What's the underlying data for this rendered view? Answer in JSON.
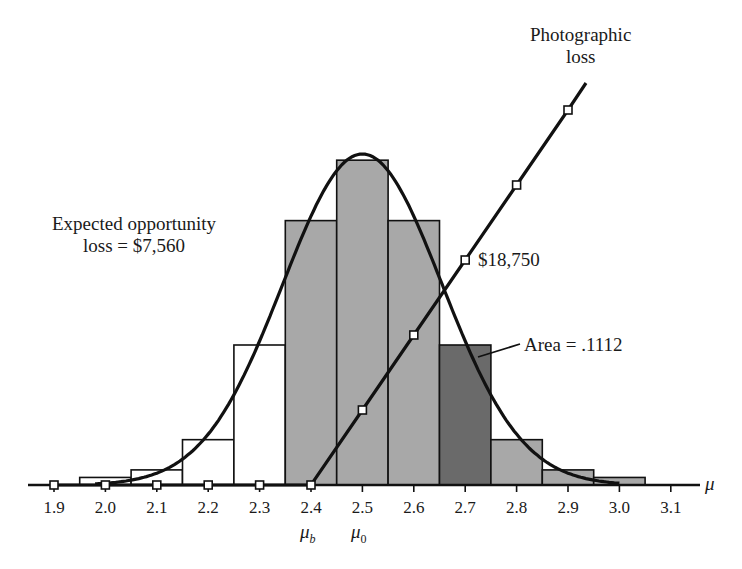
{
  "chart_data": {
    "type": "bar",
    "title": "",
    "xlabel": "μ",
    "ylabel": "",
    "x_ticks": [
      "1.9",
      "2.0",
      "2.1",
      "2.2",
      "2.3",
      "2.4",
      "2.5",
      "2.6",
      "2.7",
      "2.8",
      "2.9",
      "3.0",
      "3.1"
    ],
    "xlim": [
      1.9,
      3.1
    ],
    "grid": false,
    "legend": null,
    "series": [
      {
        "name": "Probability histogram",
        "type": "bar",
        "x": [
          2.0,
          2.1,
          2.2,
          2.3,
          2.4,
          2.5,
          2.6,
          2.7,
          2.8,
          2.9,
          3.0
        ],
        "values": [
          0.006,
          0.012,
          0.036,
          0.1112,
          0.21,
          0.258,
          0.21,
          0.1112,
          0.036,
          0.012,
          0.006
        ],
        "fills": [
          "white",
          "white",
          "white",
          "white",
          "gray",
          "gray",
          "gray",
          "dark",
          "gray",
          "gray",
          "gray"
        ]
      },
      {
        "name": "Normal curve",
        "type": "line",
        "mean": 2.5,
        "sd": 0.155
      },
      {
        "name": "Photographic loss",
        "type": "line",
        "x": [
          1.9,
          2.0,
          2.1,
          2.2,
          2.3,
          2.4,
          2.5,
          2.6,
          2.7,
          2.8,
          2.9
        ],
        "values": [
          0,
          0,
          0,
          0,
          0,
          0,
          6250,
          12500,
          18750,
          25000,
          31250
        ],
        "markers": "square"
      }
    ],
    "annotations": [
      {
        "text": "Photographic loss",
        "target": "loss line"
      },
      {
        "text": "Expected opportunity loss = $7,560"
      },
      {
        "text": "$18,750",
        "at_x": 2.7
      },
      {
        "text": "Area = .1112",
        "target": "bar 2.7"
      },
      {
        "text": "μb",
        "at_x": 2.4
      },
      {
        "text": "μ0",
        "at_x": 2.5
      }
    ]
  },
  "labels": {
    "photo_line1": "Photographic",
    "photo_line2": "loss",
    "eol_line1": "Expected opportunity",
    "eol_line2": "loss = $7,560",
    "loss_value": "$18,750",
    "area": "Area = .1112",
    "axis_symbol": "μ",
    "mu_b": "μ",
    "mu_b_sub": "b",
    "mu_0": "μ",
    "mu_0_sub": "0"
  },
  "colors": {
    "gray_fill": "#a8a8a8",
    "dark_fill": "#6a6a6a",
    "line": "#111111"
  }
}
